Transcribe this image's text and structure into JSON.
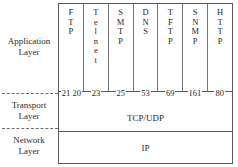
{
  "diagram": {
    "layers": [
      {
        "id": "application",
        "line1": "Application",
        "line2": "Layer"
      },
      {
        "id": "transport",
        "line1": "Transport",
        "line2": "Layer"
      },
      {
        "id": "network",
        "line1": "Network",
        "line2": "Layer"
      }
    ],
    "protocols": [
      {
        "name": "FTP",
        "letters": [
          "F",
          "T",
          "P"
        ],
        "port": "21 20"
      },
      {
        "name": "Telnet",
        "letters": [
          "T",
          "e",
          "l",
          "n",
          "e",
          "t"
        ],
        "port": "23"
      },
      {
        "name": "SMTP",
        "letters": [
          "S",
          "M",
          "T",
          "P"
        ],
        "port": "25"
      },
      {
        "name": "DNS",
        "letters": [
          "D",
          "N",
          "S"
        ],
        "port": "53"
      },
      {
        "name": "TFTP",
        "letters": [
          "T",
          "F",
          "T",
          "P"
        ],
        "port": "69"
      },
      {
        "name": "SNMP",
        "letters": [
          "S",
          "N",
          "M",
          "P"
        ],
        "port": "161"
      },
      {
        "name": "HTTP",
        "letters": [
          "H",
          "T",
          "T",
          "P"
        ],
        "port": "80"
      }
    ],
    "bands": {
      "transport": "TCP/UDP",
      "network": "IP"
    },
    "colors": {
      "box_border": "#5a5a5a",
      "column_divider": "#767676",
      "dashed_divider": "#6d6d6d",
      "text": "#1f1f1f",
      "background": "#ffffff"
    }
  }
}
